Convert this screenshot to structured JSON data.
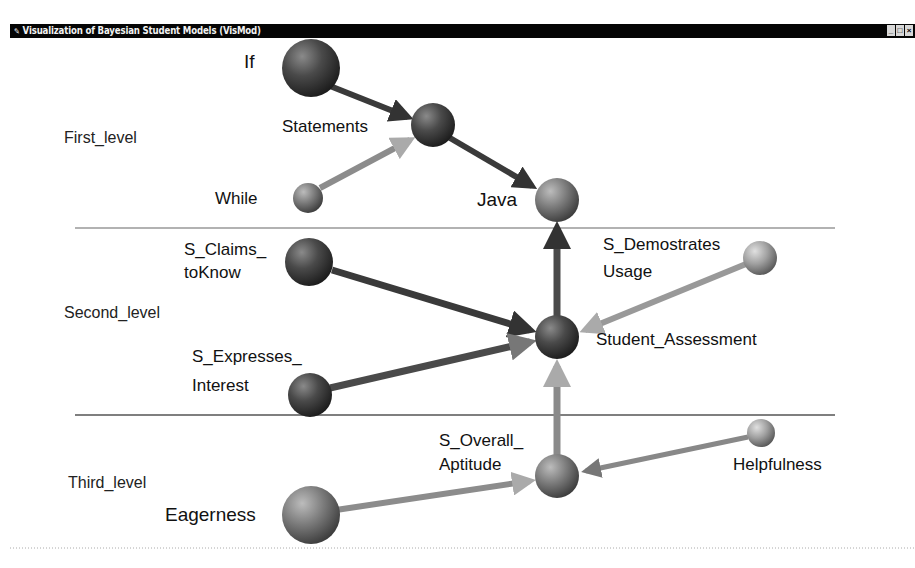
{
  "window": {
    "title": "Visualization of Bayesian Student Models (VisMod)",
    "buttons": [
      {
        "name": "minimize",
        "glyph": "_"
      },
      {
        "name": "maximize",
        "glyph": "□"
      },
      {
        "name": "close",
        "glyph": "×"
      }
    ]
  },
  "levels": [
    {
      "label": "First_level"
    },
    {
      "label": "Second_level"
    },
    {
      "label": "Third_level"
    }
  ],
  "nodes": {
    "if": {
      "label": "If"
    },
    "statements": {
      "label": "Statements"
    },
    "while": {
      "label": "While"
    },
    "java": {
      "label": "Java"
    },
    "s_claims": {
      "label_line1": "S_Claims_",
      "label_line2": "toKnow"
    },
    "s_demostrates": {
      "label_line1": "S_Demostrates",
      "label_line2": "Usage"
    },
    "student_assessment": {
      "label": "Student_Assessment"
    },
    "s_expresses": {
      "label_line1": "S_Expresses_",
      "label_line2": "Interest"
    },
    "s_overall": {
      "label_line1": "S_Overall_",
      "label_line2": "Aptitude"
    },
    "helpfulness": {
      "label": "Helpfulness"
    },
    "eagerness": {
      "label": "Eagerness"
    }
  },
  "edges": [
    {
      "from": "If",
      "to": "Statements"
    },
    {
      "from": "While",
      "to": "Statements"
    },
    {
      "from": "Statements",
      "to": "Java"
    },
    {
      "from": "Student_Assessment",
      "to": "Java"
    },
    {
      "from": "S_Claims_toKnow",
      "to": "Student_Assessment"
    },
    {
      "from": "S_Demostrates_Usage",
      "to": "Student_Assessment"
    },
    {
      "from": "S_Expresses_Interest",
      "to": "Student_Assessment"
    },
    {
      "from": "S_Overall_Aptitude",
      "to": "Student_Assessment"
    },
    {
      "from": "Eagerness",
      "to": "S_Overall_Aptitude"
    },
    {
      "from": "Helpfulness",
      "to": "S_Overall_Aptitude"
    }
  ],
  "colors": {
    "titlebar": "#050505",
    "titletext": "#f2f2f2",
    "background": "#ffffff"
  }
}
